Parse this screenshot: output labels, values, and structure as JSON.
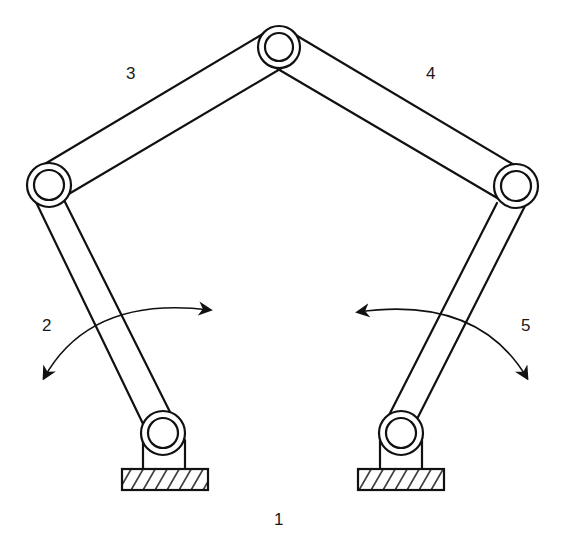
{
  "diagram": {
    "type": "five-bar linkage mechanism",
    "colors": {
      "stroke": "#111111",
      "background": "#ffffff"
    },
    "joints": {
      "top": [
        279,
        47
      ],
      "left": [
        49,
        185
      ],
      "right": [
        516,
        186
      ],
      "base_left": [
        163,
        433
      ],
      "base_right": [
        401,
        433
      ]
    },
    "labels": [
      {
        "id": "link-1",
        "text": "1",
        "x": 274,
        "y": 510
      },
      {
        "id": "link-2",
        "text": "2",
        "x": 42,
        "y": 316
      },
      {
        "id": "link-3",
        "text": "3",
        "x": 126,
        "y": 64
      },
      {
        "id": "link-4",
        "text": "4",
        "x": 426,
        "y": 64
      },
      {
        "id": "link-5",
        "text": "5",
        "x": 521,
        "y": 316
      }
    ],
    "grounds": [
      {
        "id": "ground-left",
        "x": 122,
        "y": 469,
        "w": 86,
        "h": 21
      },
      {
        "id": "ground-right",
        "x": 358,
        "y": 469,
        "w": 86,
        "h": 21
      }
    ]
  }
}
